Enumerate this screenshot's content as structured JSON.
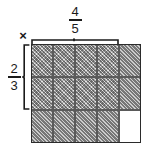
{
  "diagram": {
    "type": "area-model-fraction-multiplication",
    "operator_symbol": "×",
    "top_label": {
      "numerator": "4",
      "denominator": "5"
    },
    "left_label": {
      "numerator": "2",
      "denominator": "3"
    },
    "colors": {
      "shade": "#9a9a9a",
      "grid_line": "#5a5a5a",
      "border": "#2b2b2b",
      "empty": "#ffffff",
      "text": "#1a1a1a"
    },
    "grid": {
      "columns": 5,
      "rows": 3,
      "top_bracket_spans_columns": 4,
      "left_bracket_spans_rows": 2,
      "cells": [
        [
          "cross",
          "cross",
          "cross",
          "cross",
          "hatch"
        ],
        [
          "cross",
          "cross",
          "cross",
          "cross",
          "hatch"
        ],
        [
          "hatch",
          "hatch",
          "hatch",
          "hatch",
          "empty"
        ]
      ]
    }
  }
}
